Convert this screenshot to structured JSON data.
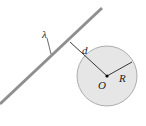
{
  "diagram": {
    "labels": {
      "lambda": "λ",
      "distance": "d",
      "radius": "R",
      "center": "O"
    },
    "colors": {
      "line_charge": "#8f8f8f",
      "sphere_fill": "#e6e6e6",
      "sphere_stroke": "#9a9a9a",
      "ink": "#222222"
    }
  }
}
